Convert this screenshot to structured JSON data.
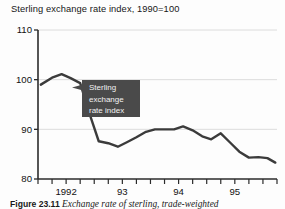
{
  "figure": {
    "caption_number": "Figure 23.11",
    "caption_text": "Exchange rate of sterling, trade-weighted"
  },
  "chart_data": {
    "type": "line",
    "title": "Sterling exchange rate index, 1990=100",
    "xlabel": "",
    "ylabel": "",
    "ylim": [
      80,
      110
    ],
    "yticks": [
      80,
      90,
      100,
      110
    ],
    "ytick_labels": [
      "80",
      "90",
      "100",
      "110"
    ],
    "grid": true,
    "grid_axis": "y",
    "legend": "none",
    "xlim": [
      1991.5,
      1995.75
    ],
    "xtick_labels": [
      "1992",
      "93",
      "94",
      "95"
    ],
    "xtick_values": [
      1992,
      1993,
      1994,
      1995
    ],
    "minor_ticks_per_year": 4,
    "line_color": "#3b3b3b",
    "grid_color": "#dcdcdc",
    "axis_color": "#2b2b2b",
    "annotations": [
      {
        "name": "series-callout",
        "lines": [
          "Sterling",
          "exchange",
          "rate index"
        ],
        "box_color": "#4a4a4a",
        "text_color": "#f2f2f2",
        "points_to_x": 1992.35,
        "points_to_y": 97.5
      }
    ],
    "series": [
      {
        "name": "Sterling exchange rate index",
        "x": [
          1991.55,
          1991.75,
          1991.92,
          1992.08,
          1992.25,
          1992.42,
          1992.58,
          1992.75,
          1992.92,
          1993.08,
          1993.25,
          1993.42,
          1993.58,
          1993.75,
          1993.92,
          1994.08,
          1994.25,
          1994.42,
          1994.58,
          1994.75,
          1994.92,
          1995.08,
          1995.25,
          1995.42,
          1995.58,
          1995.72
        ],
        "values": [
          99.0,
          100.4,
          101.1,
          100.3,
          99.3,
          93.0,
          87.6,
          87.2,
          86.5,
          87.4,
          88.4,
          89.5,
          90.0,
          90.0,
          90.0,
          90.6,
          89.8,
          88.6,
          88.0,
          89.2,
          87.3,
          85.5,
          84.3,
          84.4,
          84.2,
          83.3
        ]
      }
    ]
  }
}
